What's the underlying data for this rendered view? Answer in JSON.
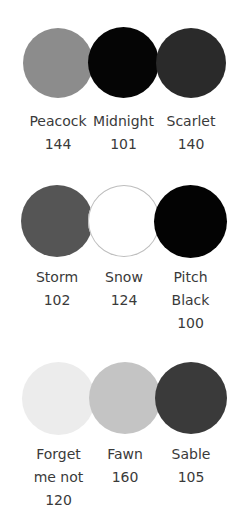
{
  "swatches": [
    {
      "name": "Peacock",
      "code": "144",
      "color": "#8c8c8c",
      "x": 23,
      "y": 28,
      "d": 70,
      "lines": [
        "Peacock",
        "144"
      ]
    },
    {
      "name": "Midnight",
      "code": "101",
      "color": "#050505",
      "x": 88,
      "y": 27,
      "d": 71,
      "lines": [
        "Midnight",
        "101"
      ]
    },
    {
      "name": "Scarlet",
      "code": "140",
      "color": "#2a2a2a",
      "x": 156,
      "y": 28,
      "d": 70,
      "lines": [
        "Scarlet",
        "140"
      ]
    },
    {
      "name": "Storm",
      "code": "102",
      "color": "#555555",
      "x": 21,
      "y": 185,
      "d": 72,
      "lines": [
        "Storm",
        "102"
      ]
    },
    {
      "name": "Snow",
      "code": "124",
      "color": "#ffffff",
      "x": 88,
      "y": 185,
      "d": 72,
      "lines": [
        "Snow",
        "124"
      ]
    },
    {
      "name": "Pitch Black",
      "code": "100",
      "color": "#030303",
      "x": 154,
      "y": 185,
      "d": 73,
      "lines": [
        "Pitch",
        "Black",
        "100"
      ]
    },
    {
      "name": "Forget me not",
      "code": "120",
      "color": "#ececec",
      "x": 22,
      "y": 362,
      "d": 73,
      "lines": [
        "Forget",
        "me not",
        "120"
      ]
    },
    {
      "name": "Fawn",
      "code": "160",
      "color": "#c4c4c4",
      "x": 89,
      "y": 362,
      "d": 72,
      "lines": [
        "Fawn",
        "160"
      ]
    },
    {
      "name": "Sable",
      "code": "105",
      "color": "#3a3a3a",
      "x": 155,
      "y": 362,
      "d": 72,
      "lines": [
        "Sable",
        "105"
      ]
    }
  ]
}
